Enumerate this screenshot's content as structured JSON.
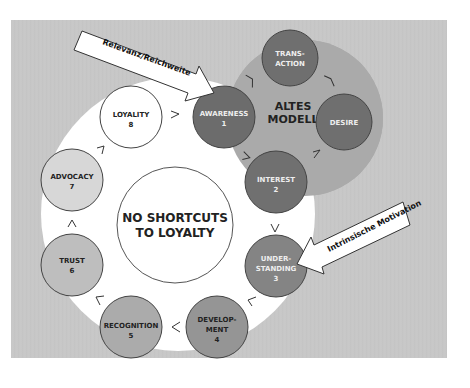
{
  "diagram": {
    "title": "NO SHORTCUTS TO LOYALTY",
    "center_label": [
      "NO SHORTCUTS",
      "TO LOYALTY"
    ],
    "old_model_label": [
      "ALTES",
      "MODELL"
    ],
    "colors": {
      "background_panel": "#c6c6c6",
      "old_model_area": "#a9a9a9",
      "dark_node": "#6f6f6f",
      "medium_node": "#8a8a8a",
      "light_node": "#bcbcbc",
      "white": "#ffffff",
      "outline": "#444444"
    },
    "nodes": [
      {
        "id": "awareness",
        "lines": [
          "AWARENESS",
          "1"
        ],
        "shade": "dark"
      },
      {
        "id": "interest",
        "lines": [
          "INTEREST",
          "2"
        ],
        "shade": "dark"
      },
      {
        "id": "understanding",
        "lines": [
          "UNDER-",
          "STANDING",
          "3"
        ],
        "shade": "medium"
      },
      {
        "id": "development",
        "lines": [
          "DEVELOP-",
          "MENT",
          "4"
        ],
        "shade": "medium_light"
      },
      {
        "id": "recognition",
        "lines": [
          "RECOGNITION",
          "5"
        ],
        "shade": "light"
      },
      {
        "id": "trust",
        "lines": [
          "TRUST",
          "6"
        ],
        "shade": "lighter"
      },
      {
        "id": "advocacy",
        "lines": [
          "ADVOCACY",
          "7"
        ],
        "shade": "lightest"
      },
      {
        "id": "loyality",
        "lines": [
          "LOYALITY",
          "8"
        ],
        "shade": "white"
      }
    ],
    "old_model_nodes": [
      {
        "id": "transaction",
        "lines": [
          "TRANS-",
          "ACTION"
        ]
      },
      {
        "id": "desire",
        "lines": [
          "DESIRE"
        ]
      }
    ],
    "arrows": [
      {
        "id": "relevanz-arrow",
        "label": "Relevanz/Reichweite",
        "points_to": "awareness"
      },
      {
        "id": "motivation-arrow",
        "label": "Intrinsische Motivation",
        "points_to": "understanding"
      }
    ],
    "connectors": {
      "loyality_to_awareness": ">",
      "awareness_to_interest": ">",
      "interest_to_understanding": "V",
      "understanding_to_development": "<",
      "development_to_recognition": "<",
      "recognition_to_trust": "<",
      "trust_to_advocacy": "Λ",
      "advocacy_to_loyality": ">",
      "awareness_to_transaction": ">",
      "desire_to_transaction": "<",
      "interest_to_desire": ">"
    }
  }
}
